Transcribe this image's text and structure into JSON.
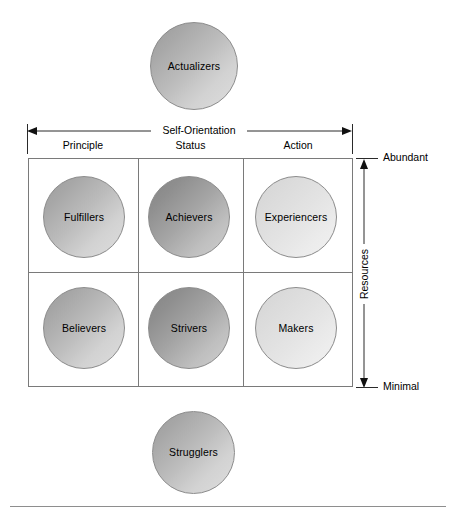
{
  "diagram": {
    "type": "framework-matrix",
    "horizontal_axis": {
      "title": "Self-Orientation",
      "arrow": "double-headed",
      "categories": [
        "Principle",
        "Status",
        "Action"
      ]
    },
    "vertical_axis": {
      "title": "Resources",
      "arrow": "double-headed",
      "top_label": "Abundant",
      "bottom_label": "Minimal"
    },
    "top_segment": {
      "label": "Actualizers",
      "tone": "tone-mid"
    },
    "bottom_segment": {
      "label": "Strugglers",
      "tone": "tone-mid"
    },
    "matrix": {
      "rows": [
        {
          "resources": "Abundant",
          "cells": [
            {
              "label": "Fulfillers",
              "orientation": "Principle",
              "tone": "tone-mid"
            },
            {
              "label": "Achievers",
              "orientation": "Status",
              "tone": "tone-dark"
            },
            {
              "label": "Experiencers",
              "orientation": "Action",
              "tone": "tone-light"
            }
          ]
        },
        {
          "resources": "Minimal",
          "cells": [
            {
              "label": "Believers",
              "orientation": "Principle",
              "tone": "tone-mid"
            },
            {
              "label": "Strivers",
              "orientation": "Status",
              "tone": "tone-dark"
            },
            {
              "label": "Makers",
              "orientation": "Action",
              "tone": "tone-light"
            }
          ]
        }
      ]
    },
    "colors": {
      "grid_line": "#7a7a7a",
      "axis_line": "#2a2a2a",
      "circle_outline": "#8c8c8c",
      "rule": "#8e8e8e",
      "text": "#000000",
      "background": "#ffffff"
    }
  }
}
